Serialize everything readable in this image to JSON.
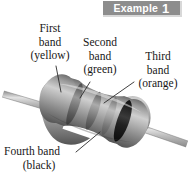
{
  "banner": {
    "word": "Example",
    "number": "1"
  },
  "labels": {
    "first": {
      "line1": "First",
      "line2": "band",
      "line3": "(yellow)"
    },
    "second": {
      "line1": "Second",
      "line2": "band",
      "line3": "(green)"
    },
    "third": {
      "line1": "Third",
      "line2": "band",
      "line3": "(orange)"
    },
    "fourth": {
      "line1": "Fourth band",
      "line2": "(black)"
    }
  },
  "figure": {
    "body_color": "#9a9a9a",
    "lead_color": "#b8b8b8",
    "band_colors": {
      "first_yellow": "#6f6f6f",
      "second_green": "#6a6a6a",
      "third_orange": "#8a8a8a",
      "fourth_black": "#1b1b1b"
    },
    "background": "#ffffff",
    "banner_color": "#8d8d8d",
    "leader_line_color": "#2b2b2b"
  }
}
